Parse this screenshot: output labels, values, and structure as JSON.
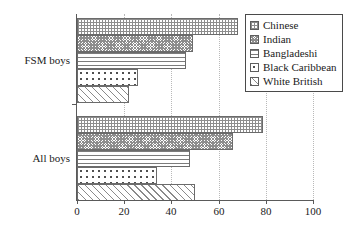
{
  "chart_data": {
    "type": "bar",
    "orientation": "horizontal",
    "grouped": true,
    "title": "",
    "xlabel": "",
    "ylabel": "",
    "categories": [
      "FSM boys",
      "All boys"
    ],
    "xlim": [
      0,
      100
    ],
    "xticks": [
      0,
      20,
      40,
      60,
      80,
      100
    ],
    "xtick_labels": [
      "0",
      "20",
      "40",
      "60",
      "80",
      "100"
    ],
    "grid": "vertical dotted gridlines at each x tick",
    "legend_position": "top-right inside plot",
    "series": [
      {
        "name": "Chinese",
        "pattern": "fine-grid",
        "values": [
          68,
          79
        ]
      },
      {
        "name": "Indian",
        "pattern": "dense-stipple",
        "values": [
          49,
          66
        ]
      },
      {
        "name": "Bangladeshi",
        "pattern": "horizontal-lines",
        "values": [
          46,
          48
        ]
      },
      {
        "name": "Black Caribbean",
        "pattern": "coarse-dots",
        "values": [
          26,
          34
        ]
      },
      {
        "name": "White British",
        "pattern": "diagonal-hatch",
        "values": [
          22,
          50
        ]
      }
    ]
  },
  "legend": {
    "items": [
      {
        "label": "Chinese"
      },
      {
        "label": "Indian"
      },
      {
        "label": "Bangladeshi"
      },
      {
        "label": "Black Caribbean"
      },
      {
        "label": "White British"
      }
    ]
  },
  "axes": {
    "x_tick_labels": [
      "0",
      "20",
      "40",
      "60",
      "80",
      "100"
    ],
    "y_tick_labels": [
      "FSM boys",
      "All boys"
    ]
  },
  "colors": {
    "axis": "#5a5a5a",
    "gridline": "#b9b9b9",
    "bar_outline": "#6b6b6b",
    "text": "#1a1a1a",
    "background": "#ffffff"
  }
}
